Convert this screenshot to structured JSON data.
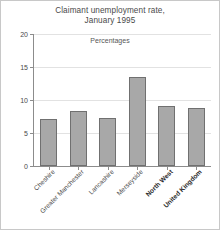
{
  "chart_data": {
    "type": "bar",
    "title": "Claimant unemployment rate, January 1995",
    "title_lines": [
      "Claimant unemployment rate,",
      "January 1995"
    ],
    "subtitle": "Percentages",
    "xlabel": "",
    "ylabel": "",
    "ylim": [
      0,
      20
    ],
    "y_ticks": [
      0,
      5,
      10,
      15,
      20
    ],
    "y_tick_labels": [
      "0",
      "5",
      "10",
      "15",
      "20"
    ],
    "grid": true,
    "legend": false,
    "categories": [
      "Cheshire",
      "Greater Manchester",
      "Lancashire",
      "Merseyside",
      "North West",
      "United Kingdom"
    ],
    "emphasized_categories": [
      "North West",
      "United Kingdom"
    ],
    "values": [
      7.1,
      8.3,
      7.3,
      13.5,
      9.1,
      8.8
    ],
    "bar_color": "#a8a8a8",
    "bar_edge_color": "#707070",
    "gridline_color": "#e2e2e2",
    "axis_color": "#8c8c8c"
  }
}
